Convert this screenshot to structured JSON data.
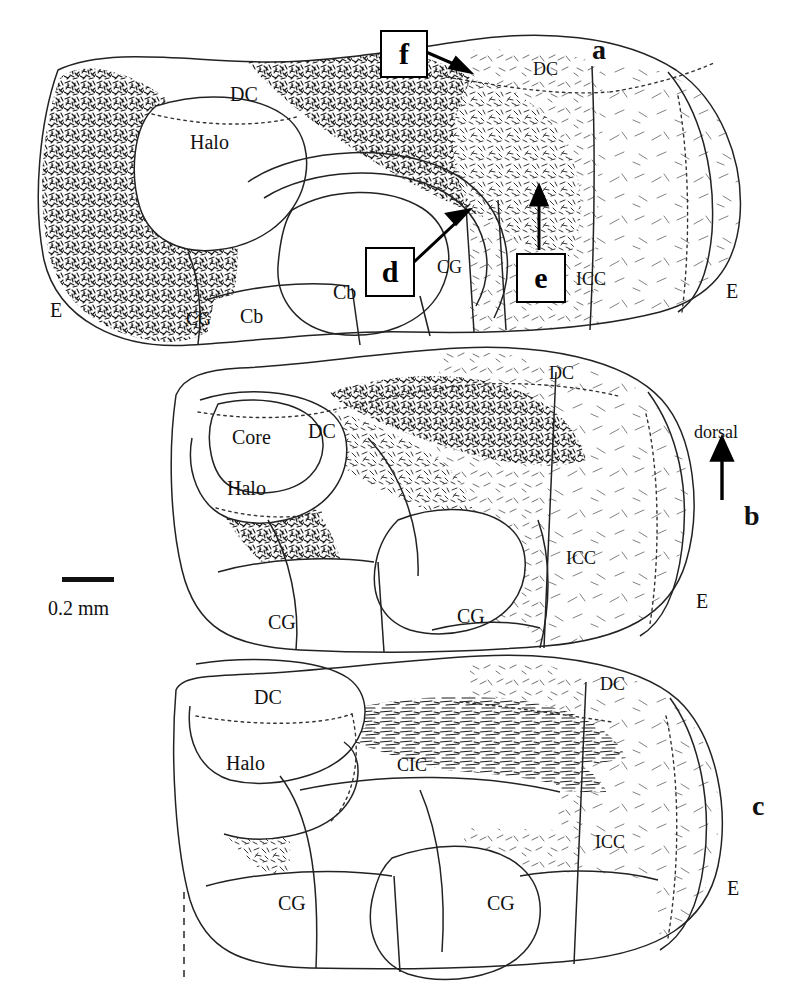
{
  "figure": {
    "ink_color": "#111111",
    "background_color": "#ffffff"
  },
  "scale": {
    "label": "0.2 mm",
    "bar_name": "scale-bar",
    "bar_length_px": 52
  },
  "orientation": {
    "label": "dorsal",
    "arrow": "up-arrow"
  },
  "panels": [
    {
      "id": "a",
      "label": "a",
      "x": 592,
      "y": 36
    },
    {
      "id": "b",
      "label": "b",
      "x": 744,
      "y": 502
    },
    {
      "id": "c",
      "label": "c",
      "x": 752,
      "y": 792
    }
  ],
  "callouts": [
    {
      "id": "f",
      "label": "f",
      "x": 380,
      "y": 30,
      "w": 44,
      "h": 44,
      "arrow": {
        "x1": 428,
        "y1": 55,
        "x2": 468,
        "y2": 72
      }
    },
    {
      "id": "d",
      "label": "d",
      "x": 365,
      "y": 247,
      "w": 46,
      "h": 46,
      "arrow": {
        "x1": 414,
        "y1": 262,
        "x2": 465,
        "y2": 213
      }
    },
    {
      "id": "e",
      "label": "e",
      "x": 516,
      "y": 253,
      "w": 46,
      "h": 46,
      "arrow": {
        "x1": 539,
        "y1": 252,
        "x2": 539,
        "y2": 190
      }
    }
  ],
  "structure_labels": [
    {
      "text": "DC",
      "x": 230,
      "y": 84,
      "size": "lg",
      "panel": "a"
    },
    {
      "text": "Halo",
      "x": 190,
      "y": 132,
      "size": "lg",
      "panel": "a"
    },
    {
      "text": "DC",
      "x": 533,
      "y": 60,
      "size": "sm",
      "panel": "a"
    },
    {
      "text": "E",
      "x": 50,
      "y": 300,
      "size": "lg",
      "panel": "a"
    },
    {
      "text": "CG",
      "x": 186,
      "y": 310,
      "size": "sm",
      "panel": "a"
    },
    {
      "text": "Cb",
      "x": 240,
      "y": 306,
      "size": "lg",
      "panel": "a"
    },
    {
      "text": "Cb",
      "x": 333,
      "y": 282,
      "size": "lg",
      "panel": "a"
    },
    {
      "text": "CG",
      "x": 437,
      "y": 258,
      "size": "sm",
      "panel": "a"
    },
    {
      "text": "ICC",
      "x": 576,
      "y": 270,
      "size": "sm",
      "panel": "a"
    },
    {
      "text": "E",
      "x": 726,
      "y": 281,
      "size": "lg",
      "panel": "a"
    },
    {
      "text": "DC",
      "x": 308,
      "y": 421,
      "size": "lg",
      "panel": "b"
    },
    {
      "text": "Core",
      "x": 232,
      "y": 427,
      "size": "lg",
      "panel": "b"
    },
    {
      "text": "Halo",
      "x": 227,
      "y": 478,
      "size": "lg",
      "panel": "b"
    },
    {
      "text": "DC",
      "x": 549,
      "y": 364,
      "size": "sm",
      "panel": "b"
    },
    {
      "text": "ICC",
      "x": 566,
      "y": 549,
      "size": "sm",
      "panel": "b"
    },
    {
      "text": "E",
      "x": 696,
      "y": 591,
      "size": "lg",
      "panel": "b"
    },
    {
      "text": "CG",
      "x": 268,
      "y": 612,
      "size": "lg",
      "panel": "b"
    },
    {
      "text": "CG",
      "x": 457,
      "y": 606,
      "size": "lg",
      "panel": "b"
    },
    {
      "text": "DC",
      "x": 254,
      "y": 687,
      "size": "lg",
      "panel": "c"
    },
    {
      "text": "Halo",
      "x": 226,
      "y": 753,
      "size": "lg",
      "panel": "c"
    },
    {
      "text": "CIC",
      "x": 397,
      "y": 756,
      "size": "sm",
      "panel": "c"
    },
    {
      "text": "DC",
      "x": 600,
      "y": 675,
      "size": "sm",
      "panel": "c"
    },
    {
      "text": "ICC",
      "x": 595,
      "y": 833,
      "size": "sm",
      "panel": "c"
    },
    {
      "text": "E",
      "x": 727,
      "y": 878,
      "size": "lg",
      "panel": "c"
    },
    {
      "text": "CG",
      "x": 278,
      "y": 893,
      "size": "lg",
      "panel": "c"
    },
    {
      "text": "CG",
      "x": 487,
      "y": 893,
      "size": "lg",
      "panel": "c"
    }
  ]
}
